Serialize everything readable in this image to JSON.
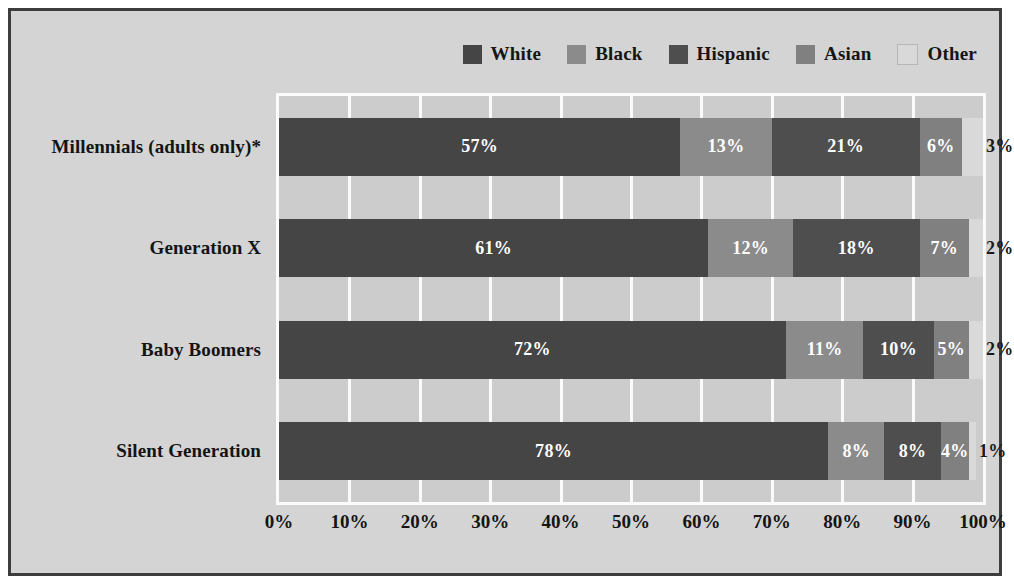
{
  "chart_data": {
    "type": "bar",
    "subtype": "stacked-horizontal-100pct",
    "title": "",
    "xlabel": "",
    "ylabel": "",
    "xlim": [
      0,
      100
    ],
    "grid": true,
    "legend_position": "top-right",
    "categories": [
      "Millennials (adults only)*",
      "Generation X",
      "Baby Boomers",
      "Silent Generation"
    ],
    "series": [
      {
        "name": "White",
        "color": "#454545",
        "values": [
          57,
          61,
          72,
          78
        ]
      },
      {
        "name": "Black",
        "color": "#8b8b8b",
        "values": [
          13,
          12,
          11,
          8
        ]
      },
      {
        "name": "Hispanic",
        "color": "#4e4e4e",
        "values": [
          21,
          18,
          10,
          8
        ]
      },
      {
        "name": "Asian",
        "color": "#808080",
        "values": [
          6,
          7,
          5,
          4
        ]
      },
      {
        "name": "Other",
        "color": "#d9d9d9",
        "values": [
          3,
          2,
          2,
          1
        ]
      }
    ],
    "value_labels": [
      [
        "57%",
        "13%",
        "21%",
        "6%",
        "3%"
      ],
      [
        "61%",
        "12%",
        "18%",
        "7%",
        "2%"
      ],
      [
        "72%",
        "11%",
        "10%",
        "5%",
        "2%"
      ],
      [
        "78%",
        "8%",
        "8%",
        "4%",
        "1%"
      ]
    ],
    "xticks": [
      "0%",
      "10%",
      "20%",
      "30%",
      "40%",
      "50%",
      "60%",
      "70%",
      "80%",
      "90%",
      "100%"
    ],
    "xtick_values": [
      0,
      10,
      20,
      30,
      40,
      50,
      60,
      70,
      80,
      90,
      100
    ]
  },
  "legend": {
    "items": [
      {
        "label": "White",
        "color": "#454545"
      },
      {
        "label": "Black",
        "color": "#8b8b8b"
      },
      {
        "label": "Hispanic",
        "color": "#4e4e4e"
      },
      {
        "label": "Asian",
        "color": "#808080"
      },
      {
        "label": "Other",
        "color": "#d9d9d9"
      }
    ]
  },
  "style": {
    "plot_background": "#cccccc",
    "figure_background": "#d4d4d4",
    "gridline_color": "#fbfbfb",
    "border_color": "#3d3d3d",
    "text_color": "#141414"
  }
}
